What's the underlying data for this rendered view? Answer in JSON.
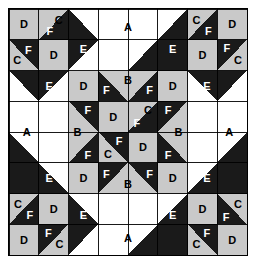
{
  "colors": {
    "background": "#ffffff",
    "fabric_light": "#ffffff",
    "fabric_medium": "#c9c9c9",
    "fabric_dark": "#1a1a1a",
    "outline": "#000000",
    "label_dark": "#000000",
    "label_light": "#ffffff"
  },
  "geometry": {
    "frame_x": 8,
    "frame_y": 8,
    "frame_width": 240,
    "frame_height": 248,
    "grid_units_x": 8,
    "grid_units_y": 8,
    "unit_width": 29.75,
    "unit_height": 30.75
  },
  "piece_legend": [
    {
      "code": "A",
      "description": "large light triangle"
    },
    {
      "code": "B",
      "description": "medium triangle"
    },
    {
      "code": "C",
      "description": "small light triangle"
    },
    {
      "code": "D",
      "description": "medium square"
    },
    {
      "code": "E",
      "description": "large dark triangle"
    },
    {
      "code": "F",
      "description": "small dark triangle"
    }
  ],
  "shapes": [
    {
      "name": "corner-tl-d-square",
      "kind": "rect",
      "pts": [
        0,
        0,
        2,
        0,
        2,
        2,
        0,
        2
      ],
      "fill": "fabric_medium",
      "scale": "half"
    },
    {
      "name": "corner-tl-c-triangle",
      "kind": "poly",
      "pts": [
        2,
        0,
        4,
        0,
        2,
        2
      ],
      "fill": "fabric_medium",
      "scale": "half"
    },
    {
      "name": "corner-tl-f-triangle",
      "kind": "poly",
      "pts": [
        4,
        0,
        4,
        2,
        2,
        2
      ],
      "fill": "fabric_dark",
      "scale": "half"
    },
    {
      "name": "corner-tl-f2-triangle",
      "kind": "poly",
      "pts": [
        0,
        2,
        2,
        2,
        2,
        4
      ],
      "fill": "fabric_dark",
      "scale": "half"
    },
    {
      "name": "corner-tl-c2-triangle",
      "kind": "poly",
      "pts": [
        0,
        2,
        2,
        4,
        0,
        4
      ],
      "fill": "fabric_medium",
      "scale": "half"
    },
    {
      "name": "corner-tl-d2-square",
      "kind": "rect",
      "pts": [
        2,
        2,
        4,
        2,
        4,
        4,
        2,
        4
      ],
      "fill": "fabric_medium",
      "scale": "half"
    },
    {
      "name": "corner-tr-c-triangle",
      "kind": "poly",
      "pts": [
        12,
        0,
        14,
        0,
        12,
        2
      ],
      "fill": "fabric_medium",
      "scale": "half"
    },
    {
      "name": "corner-tr-f-triangle",
      "kind": "poly",
      "pts": [
        14,
        0,
        14,
        2,
        12,
        2
      ],
      "fill": "fabric_dark",
      "scale": "half"
    },
    {
      "name": "corner-tr-d-square",
      "kind": "rect",
      "pts": [
        14,
        0,
        16,
        0,
        16,
        2,
        14,
        2
      ],
      "fill": "fabric_medium",
      "scale": "half"
    },
    {
      "name": "corner-tr-d2-square",
      "kind": "rect",
      "pts": [
        12,
        2,
        14,
        2,
        14,
        4,
        12,
        4
      ],
      "fill": "fabric_medium",
      "scale": "half"
    },
    {
      "name": "corner-tr-f2-triangle",
      "kind": "poly",
      "pts": [
        14,
        2,
        16,
        2,
        14,
        4
      ],
      "fill": "fabric_dark",
      "scale": "half"
    },
    {
      "name": "corner-tr-c2-triangle",
      "kind": "poly",
      "pts": [
        16,
        2,
        16,
        4,
        14,
        4
      ],
      "fill": "fabric_medium",
      "scale": "half"
    },
    {
      "name": "corner-bl-c-triangle",
      "kind": "poly",
      "pts": [
        0,
        12,
        2,
        12,
        0,
        14
      ],
      "fill": "fabric_medium",
      "scale": "half"
    },
    {
      "name": "corner-bl-f-triangle",
      "kind": "poly",
      "pts": [
        2,
        12,
        2,
        14,
        0,
        14
      ],
      "fill": "fabric_dark",
      "scale": "half"
    },
    {
      "name": "corner-bl-d-square",
      "kind": "rect",
      "pts": [
        2,
        12,
        4,
        12,
        4,
        14,
        2,
        14
      ],
      "fill": "fabric_medium",
      "scale": "half"
    },
    {
      "name": "corner-bl-d2-square",
      "kind": "rect",
      "pts": [
        0,
        14,
        2,
        14,
        2,
        16,
        0,
        16
      ],
      "fill": "fabric_medium",
      "scale": "half"
    },
    {
      "name": "corner-bl-f2-triangle",
      "kind": "poly",
      "pts": [
        2,
        14,
        4,
        14,
        2,
        16
      ],
      "fill": "fabric_dark",
      "scale": "half"
    },
    {
      "name": "corner-bl-c2-triangle",
      "kind": "poly",
      "pts": [
        4,
        14,
        4,
        16,
        2,
        16
      ],
      "fill": "fabric_medium",
      "scale": "half"
    },
    {
      "name": "corner-br-d-square",
      "kind": "rect",
      "pts": [
        12,
        12,
        14,
        12,
        14,
        14,
        12,
        14
      ],
      "fill": "fabric_medium",
      "scale": "half"
    },
    {
      "name": "corner-br-c-triangle",
      "kind": "poly",
      "pts": [
        14,
        12,
        16,
        12,
        16,
        14
      ],
      "fill": "fabric_medium",
      "scale": "half"
    },
    {
      "name": "corner-br-f-triangle",
      "kind": "poly",
      "pts": [
        14,
        12,
        16,
        14,
        14,
        14
      ],
      "fill": "fabric_dark",
      "scale": "half"
    },
    {
      "name": "corner-br-f2-triangle",
      "kind": "poly",
      "pts": [
        12,
        14,
        14,
        14,
        14,
        16
      ],
      "fill": "fabric_dark",
      "scale": "half"
    },
    {
      "name": "corner-br-c2-triangle",
      "kind": "poly",
      "pts": [
        12,
        14,
        14,
        16,
        12,
        16
      ],
      "fill": "fabric_medium",
      "scale": "half"
    },
    {
      "name": "corner-br-d2-square",
      "kind": "rect",
      "pts": [
        14,
        14,
        16,
        14,
        16,
        16,
        14,
        16
      ],
      "fill": "fabric_medium",
      "scale": "half"
    },
    {
      "name": "edge-top-e-left",
      "kind": "poly",
      "pts": [
        4,
        0,
        8,
        0,
        4,
        4
      ],
      "fill": "fabric_dark",
      "scale": "half"
    },
    {
      "name": "edge-top-a",
      "kind": "poly",
      "pts": [
        4,
        0,
        12,
        0,
        8,
        4
      ],
      "fill": "fabric_light",
      "scale": "half"
    },
    {
      "name": "edge-top-e-right",
      "kind": "poly",
      "pts": [
        12,
        0,
        12,
        4,
        8,
        4
      ],
      "fill": "fabric_dark",
      "scale": "half"
    },
    {
      "name": "edge-bottom-e-left",
      "kind": "poly",
      "pts": [
        4,
        12,
        8,
        16,
        4,
        16
      ],
      "fill": "fabric_dark",
      "scale": "half"
    },
    {
      "name": "edge-bottom-a",
      "kind": "poly",
      "pts": [
        8,
        12,
        12,
        16,
        4,
        16
      ],
      "fill": "fabric_light",
      "scale": "half"
    },
    {
      "name": "edge-bottom-e-right",
      "kind": "poly",
      "pts": [
        12,
        12,
        12,
        16,
        8,
        16
      ],
      "fill": "fabric_dark",
      "scale": "half"
    },
    {
      "name": "edge-left-e-top",
      "kind": "poly",
      "pts": [
        0,
        4,
        4,
        4,
        0,
        8
      ],
      "fill": "fabric_dark",
      "scale": "half"
    },
    {
      "name": "edge-left-a",
      "kind": "poly",
      "pts": [
        0,
        4,
        4,
        8,
        0,
        12
      ],
      "fill": "fabric_light",
      "scale": "half"
    },
    {
      "name": "edge-left-e-bottom",
      "kind": "poly",
      "pts": [
        0,
        8,
        4,
        12,
        0,
        12
      ],
      "fill": "fabric_dark",
      "scale": "half"
    },
    {
      "name": "edge-right-e-top",
      "kind": "poly",
      "pts": [
        12,
        4,
        16,
        4,
        16,
        8
      ],
      "fill": "fabric_dark",
      "scale": "half"
    },
    {
      "name": "edge-right-a",
      "kind": "poly",
      "pts": [
        12,
        8,
        16,
        4,
        16,
        12
      ],
      "fill": "fabric_light",
      "scale": "half"
    },
    {
      "name": "edge-right-e-bottom",
      "kind": "poly",
      "pts": [
        12,
        12,
        16,
        8,
        16,
        12
      ],
      "fill": "fabric_dark",
      "scale": "half"
    },
    {
      "name": "center-bg",
      "kind": "rect",
      "pts": [
        4,
        4,
        12,
        4,
        12,
        12,
        4,
        12
      ],
      "fill": "fabric_dark",
      "scale": "half"
    },
    {
      "name": "center-d-tl",
      "kind": "rect",
      "pts": [
        4,
        4,
        6,
        4,
        6,
        6,
        4,
        6
      ],
      "fill": "fabric_medium",
      "scale": "half"
    },
    {
      "name": "center-d-tr",
      "kind": "rect",
      "pts": [
        10,
        4,
        12,
        4,
        12,
        6,
        10,
        6
      ],
      "fill": "fabric_medium",
      "scale": "half"
    },
    {
      "name": "center-d-bl",
      "kind": "rect",
      "pts": [
        4,
        10,
        6,
        10,
        6,
        12,
        4,
        12
      ],
      "fill": "fabric_medium",
      "scale": "half"
    },
    {
      "name": "center-d-br",
      "kind": "rect",
      "pts": [
        10,
        10,
        12,
        10,
        12,
        12,
        10,
        12
      ],
      "fill": "fabric_medium",
      "scale": "half"
    },
    {
      "name": "center-b-top",
      "kind": "poly",
      "pts": [
        6,
        4,
        10,
        4,
        8,
        6
      ],
      "fill": "fabric_medium",
      "scale": "half"
    },
    {
      "name": "center-b-bottom",
      "kind": "poly",
      "pts": [
        8,
        10,
        10,
        12,
        6,
        12
      ],
      "fill": "fabric_medium",
      "scale": "half"
    },
    {
      "name": "center-b-left",
      "kind": "poly",
      "pts": [
        4,
        6,
        6,
        8,
        4,
        10
      ],
      "fill": "fabric_medium",
      "scale": "half"
    },
    {
      "name": "center-b-right",
      "kind": "poly",
      "pts": [
        12,
        6,
        12,
        10,
        10,
        8
      ],
      "fill": "fabric_medium",
      "scale": "half"
    },
    {
      "name": "center-inner-d-tl",
      "kind": "rect",
      "pts": [
        6,
        6,
        8,
        6,
        8,
        8,
        6,
        8
      ],
      "fill": "fabric_medium",
      "scale": "half"
    },
    {
      "name": "center-inner-d-br",
      "kind": "rect",
      "pts": [
        8,
        8,
        10,
        8,
        10,
        10,
        8,
        10
      ],
      "fill": "fabric_medium",
      "scale": "half"
    },
    {
      "name": "center-inner-c-tr",
      "kind": "poly",
      "pts": [
        8,
        6,
        10,
        6,
        8,
        8
      ],
      "fill": "fabric_medium",
      "scale": "half"
    },
    {
      "name": "center-inner-c-bl",
      "kind": "poly",
      "pts": [
        6,
        8,
        8,
        10,
        6,
        10
      ],
      "fill": "fabric_medium",
      "scale": "half"
    }
  ],
  "labels": [
    {
      "name": "label-corner-tl-d",
      "text": "D",
      "x": 1.0,
      "y": 1.0,
      "tone": "dark"
    },
    {
      "name": "label-corner-tl-c",
      "text": "C",
      "x": 3.35,
      "y": 0.7,
      "tone": "dark"
    },
    {
      "name": "label-corner-tl-f",
      "text": "F",
      "x": 2.75,
      "y": 1.45,
      "tone": "light"
    },
    {
      "name": "label-corner-tl-f2",
      "text": "F",
      "x": 1.3,
      "y": 2.65,
      "tone": "light"
    },
    {
      "name": "label-corner-tl-c2",
      "text": "C",
      "x": 0.55,
      "y": 3.3,
      "tone": "dark"
    },
    {
      "name": "label-corner-tl-d2",
      "text": "D",
      "x": 3.0,
      "y": 3.0,
      "tone": "dark"
    },
    {
      "name": "label-corner-tr-c",
      "text": "C",
      "x": 12.6,
      "y": 0.7,
      "tone": "dark"
    },
    {
      "name": "label-corner-tr-f",
      "text": "F",
      "x": 13.4,
      "y": 1.45,
      "tone": "light"
    },
    {
      "name": "label-corner-tr-d",
      "text": "D",
      "x": 15.0,
      "y": 1.0,
      "tone": "dark"
    },
    {
      "name": "label-corner-tr-d2",
      "text": "D",
      "x": 13.0,
      "y": 3.0,
      "tone": "dark"
    },
    {
      "name": "label-corner-tr-f2",
      "text": "F",
      "x": 14.65,
      "y": 2.55,
      "tone": "light"
    },
    {
      "name": "label-corner-tr-c2",
      "text": "C",
      "x": 15.4,
      "y": 3.3,
      "tone": "dark"
    },
    {
      "name": "label-corner-bl-c",
      "text": "C",
      "x": 0.6,
      "y": 12.7,
      "tone": "dark"
    },
    {
      "name": "label-corner-bl-f",
      "text": "F",
      "x": 1.4,
      "y": 13.4,
      "tone": "light"
    },
    {
      "name": "label-corner-bl-d",
      "text": "D",
      "x": 3.0,
      "y": 13.0,
      "tone": "dark"
    },
    {
      "name": "label-corner-bl-d2",
      "text": "D",
      "x": 1.0,
      "y": 15.0,
      "tone": "dark"
    },
    {
      "name": "label-corner-bl-f2",
      "text": "F",
      "x": 2.65,
      "y": 14.55,
      "tone": "light"
    },
    {
      "name": "label-corner-bl-c2",
      "text": "C",
      "x": 3.4,
      "y": 15.3,
      "tone": "dark"
    },
    {
      "name": "label-corner-br-d",
      "text": "D",
      "x": 13.0,
      "y": 13.0,
      "tone": "dark"
    },
    {
      "name": "label-corner-br-c",
      "text": "C",
      "x": 15.4,
      "y": 12.7,
      "tone": "dark"
    },
    {
      "name": "label-corner-br-f",
      "text": "F",
      "x": 14.6,
      "y": 13.5,
      "tone": "light"
    },
    {
      "name": "label-corner-br-f2",
      "text": "F",
      "x": 13.3,
      "y": 14.6,
      "tone": "light"
    },
    {
      "name": "label-corner-br-c2",
      "text": "C",
      "x": 12.6,
      "y": 15.3,
      "tone": "dark"
    },
    {
      "name": "label-corner-br-d2",
      "text": "D",
      "x": 15.0,
      "y": 15.0,
      "tone": "dark"
    },
    {
      "name": "label-edge-top-a",
      "text": "A",
      "x": 8.0,
      "y": 1.2,
      "tone": "dark"
    },
    {
      "name": "label-edge-top-e-left",
      "text": "E",
      "x": 5.0,
      "y": 2.6,
      "tone": "light"
    },
    {
      "name": "label-edge-top-e-right",
      "text": "E",
      "x": 11.0,
      "y": 2.6,
      "tone": "light"
    },
    {
      "name": "label-edge-bottom-a",
      "text": "A",
      "x": 8.0,
      "y": 14.9,
      "tone": "dark"
    },
    {
      "name": "label-edge-bottom-e-left",
      "text": "E",
      "x": 5.0,
      "y": 13.4,
      "tone": "light"
    },
    {
      "name": "label-edge-bottom-e-right",
      "text": "E",
      "x": 11.0,
      "y": 13.4,
      "tone": "light"
    },
    {
      "name": "label-edge-left-a",
      "text": "A",
      "x": 1.2,
      "y": 8.0,
      "tone": "dark"
    },
    {
      "name": "label-edge-left-e-top",
      "text": "E",
      "x": 2.7,
      "y": 5.0,
      "tone": "light"
    },
    {
      "name": "label-edge-left-e-bottom",
      "text": "E",
      "x": 2.7,
      "y": 11.0,
      "tone": "light"
    },
    {
      "name": "label-edge-right-a",
      "text": "A",
      "x": 14.8,
      "y": 8.0,
      "tone": "dark"
    },
    {
      "name": "label-edge-right-e-top",
      "text": "E",
      "x": 13.3,
      "y": 5.0,
      "tone": "light"
    },
    {
      "name": "label-edge-right-e-bottom",
      "text": "E",
      "x": 13.3,
      "y": 11.0,
      "tone": "light"
    },
    {
      "name": "label-center-d-tl",
      "text": "D",
      "x": 5.0,
      "y": 5.0,
      "tone": "dark"
    },
    {
      "name": "label-center-d-tr",
      "text": "D",
      "x": 11.0,
      "y": 5.0,
      "tone": "dark"
    },
    {
      "name": "label-center-d-bl",
      "text": "D",
      "x": 5.0,
      "y": 11.0,
      "tone": "dark"
    },
    {
      "name": "label-center-d-br",
      "text": "D",
      "x": 11.0,
      "y": 11.0,
      "tone": "dark"
    },
    {
      "name": "label-center-b-top",
      "text": "B",
      "x": 8.0,
      "y": 4.6,
      "tone": "dark"
    },
    {
      "name": "label-center-b-bottom",
      "text": "B",
      "x": 8.0,
      "y": 11.4,
      "tone": "dark"
    },
    {
      "name": "label-center-b-left",
      "text": "B",
      "x": 4.6,
      "y": 8.0,
      "tone": "dark"
    },
    {
      "name": "label-center-b-right",
      "text": "B",
      "x": 11.4,
      "y": 8.0,
      "tone": "dark"
    },
    {
      "name": "label-center-f-tl",
      "text": "F",
      "x": 6.55,
      "y": 5.3,
      "tone": "light"
    },
    {
      "name": "label-center-f-tr",
      "text": "F",
      "x": 9.45,
      "y": 5.3,
      "tone": "light"
    },
    {
      "name": "label-center-f-lt",
      "text": "F",
      "x": 5.3,
      "y": 6.55,
      "tone": "light"
    },
    {
      "name": "label-center-f-rt",
      "text": "F",
      "x": 10.7,
      "y": 6.55,
      "tone": "light"
    },
    {
      "name": "label-center-f-lb",
      "text": "F",
      "x": 5.3,
      "y": 9.5,
      "tone": "light"
    },
    {
      "name": "label-center-f-rb",
      "text": "F",
      "x": 10.7,
      "y": 9.5,
      "tone": "light"
    },
    {
      "name": "label-center-f-bl",
      "text": "F",
      "x": 6.55,
      "y": 10.7,
      "tone": "light"
    },
    {
      "name": "label-center-f-br",
      "text": "F",
      "x": 9.45,
      "y": 10.7,
      "tone": "light"
    },
    {
      "name": "label-center-inner-d-tl",
      "text": "D",
      "x": 7.0,
      "y": 7.0,
      "tone": "dark"
    },
    {
      "name": "label-center-inner-d-br",
      "text": "D",
      "x": 9.0,
      "y": 9.0,
      "tone": "dark"
    },
    {
      "name": "label-center-inner-c-tr",
      "text": "C",
      "x": 9.35,
      "y": 6.6,
      "tone": "dark"
    },
    {
      "name": "label-center-inner-f-tr",
      "text": "F",
      "x": 8.6,
      "y": 7.4,
      "tone": "light"
    },
    {
      "name": "label-center-inner-c-bl",
      "text": "C",
      "x": 6.65,
      "y": 9.4,
      "tone": "dark"
    },
    {
      "name": "label-center-inner-f-bl",
      "text": "F",
      "x": 7.4,
      "y": 8.6,
      "tone": "light"
    }
  ]
}
